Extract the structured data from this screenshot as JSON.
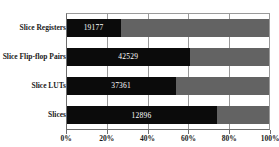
{
  "chart_data": {
    "type": "bar",
    "orientation": "horizontal",
    "stacked": true,
    "title": "",
    "xlabel": "",
    "ylabel": "",
    "xlim": [
      0,
      100
    ],
    "grid": true,
    "legend": "none",
    "categories": [
      "Slice Registers",
      "Slice Flip-flop Pairs",
      "Slice LUTs",
      "Slices"
    ],
    "tick_labels": [
      "0%",
      "20%",
      "40%",
      "60%",
      "80%",
      "100%"
    ],
    "tick_values": [
      0,
      20,
      40,
      60,
      80,
      100
    ],
    "series": [
      {
        "name": "Used",
        "color": "#0b0b0b",
        "values": [
          27,
          61,
          54,
          74
        ],
        "data_labels": [
          "19177",
          "42529",
          "37361",
          "12896"
        ]
      },
      {
        "name": "Available",
        "color": "#636363",
        "values": [
          73,
          39,
          46,
          26
        ],
        "data_labels": [
          "",
          "",
          "",
          ""
        ]
      }
    ]
  },
  "axis": {
    "frame_color": "#6e6e6e",
    "gridline_color": "#9a9a9a"
  }
}
